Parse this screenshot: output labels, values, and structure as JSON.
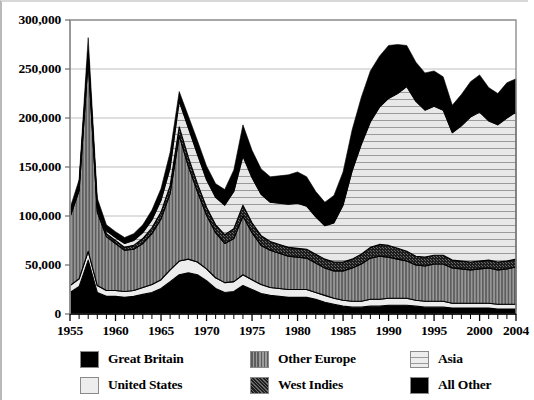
{
  "chart_data": {
    "type": "area",
    "stacked": true,
    "title": "",
    "xlabel": "",
    "ylabel": "",
    "xlim": [
      1955,
      2004
    ],
    "ylim": [
      0,
      300000
    ],
    "ytick_labels": [
      "0",
      "50,000",
      "100,000",
      "150,000",
      "200,000",
      "250,000",
      "300,000"
    ],
    "ytick_values": [
      0,
      50000,
      100000,
      150000,
      200000,
      250000,
      300000
    ],
    "xtick_labels": [
      "1955",
      "1960",
      "1965",
      "1970",
      "1975",
      "1980",
      "1985",
      "1990",
      "1995",
      "2000",
      "2004"
    ],
    "xtick_values": [
      1955,
      1960,
      1965,
      1970,
      1975,
      1980,
      1985,
      1990,
      1995,
      2000,
      2004
    ],
    "minor_xticks_every": 1,
    "grid": "horizontal",
    "grid_color": "#bfbfbf",
    "legend_position": "bottom",
    "x": [
      1955,
      1956,
      1957,
      1958,
      1959,
      1960,
      1961,
      1962,
      1963,
      1964,
      1965,
      1966,
      1967,
      1968,
      1969,
      1970,
      1971,
      1972,
      1973,
      1974,
      1975,
      1976,
      1977,
      1978,
      1979,
      1980,
      1981,
      1982,
      1983,
      1984,
      1985,
      1986,
      1987,
      1988,
      1989,
      1990,
      1991,
      1992,
      1993,
      1994,
      1995,
      1996,
      1997,
      1998,
      1999,
      2000,
      2001,
      2002,
      2003,
      2004
    ],
    "series": [
      {
        "name": "Great Britain",
        "color": "#000000",
        "pattern": "solid",
        "values": [
          22000,
          28000,
          55000,
          22000,
          18000,
          18000,
          17000,
          18000,
          20000,
          22000,
          26000,
          33000,
          40000,
          42000,
          40000,
          34000,
          26000,
          22000,
          23000,
          29000,
          25000,
          21000,
          19000,
          18000,
          17000,
          17000,
          17000,
          15000,
          12000,
          10000,
          8000,
          7000,
          7000,
          8000,
          8000,
          9000,
          9000,
          9000,
          8000,
          7000,
          7000,
          7000,
          6000,
          6000,
          6000,
          6000,
          6000,
          5000,
          5000,
          5000
        ]
      },
      {
        "name": "United States",
        "color": "#ededed",
        "pattern": "solid-light",
        "values": [
          7000,
          8000,
          9000,
          7000,
          6000,
          6000,
          6000,
          6000,
          7000,
          8000,
          9000,
          12000,
          14000,
          14000,
          13000,
          12000,
          11000,
          10000,
          10000,
          11000,
          10000,
          9000,
          8000,
          8000,
          8000,
          8000,
          8000,
          7000,
          7000,
          6000,
          6000,
          6000,
          6000,
          7000,
          7000,
          7000,
          7000,
          7000,
          6000,
          6000,
          6000,
          6000,
          5000,
          5000,
          5000,
          5000,
          5000,
          5000,
          5000,
          5000
        ]
      },
      {
        "name": "Other Europe",
        "color": "#7a7a7a",
        "pattern": "vertical-stripes",
        "values": [
          70000,
          90000,
          195000,
          75000,
          55000,
          48000,
          42000,
          42000,
          45000,
          52000,
          62000,
          78000,
          128000,
          95000,
          72000,
          55000,
          46000,
          40000,
          44000,
          60000,
          48000,
          40000,
          38000,
          36000,
          34000,
          33000,
          32000,
          30000,
          28000,
          28000,
          30000,
          34000,
          38000,
          42000,
          44000,
          42000,
          40000,
          38000,
          36000,
          36000,
          38000,
          38000,
          36000,
          35000,
          34000,
          35000,
          36000,
          35000,
          36000,
          38000
        ]
      },
      {
        "name": "West Indies",
        "color": "#2a2a2a",
        "pattern": "dense-dots",
        "values": [
          3000,
          4000,
          5000,
          4000,
          3000,
          3000,
          3000,
          4000,
          5000,
          6000,
          7000,
          8000,
          9000,
          9000,
          8000,
          8000,
          8000,
          9000,
          10000,
          11000,
          10000,
          10000,
          9000,
          9000,
          9000,
          9000,
          9000,
          9000,
          9000,
          9000,
          9000,
          9000,
          10000,
          11000,
          12000,
          12000,
          11000,
          10000,
          9000,
          9000,
          9000,
          9000,
          8000,
          8000,
          8000,
          8000,
          8000,
          8000,
          8000,
          8000
        ]
      },
      {
        "name": "Asia",
        "color": "#e3e3e3",
        "pattern": "horizontal-stripes",
        "values": [
          2000,
          2000,
          3000,
          3000,
          3000,
          3000,
          4000,
          5000,
          6000,
          8000,
          12000,
          18000,
          26000,
          30000,
          30000,
          28000,
          28000,
          30000,
          38000,
          50000,
          46000,
          42000,
          40000,
          42000,
          44000,
          46000,
          44000,
          38000,
          34000,
          40000,
          58000,
          90000,
          112000,
          128000,
          140000,
          150000,
          158000,
          168000,
          158000,
          150000,
          152000,
          148000,
          130000,
          138000,
          148000,
          152000,
          142000,
          140000,
          146000,
          150000
        ]
      },
      {
        "name": "All Other",
        "color": "#000000",
        "pattern": "solid",
        "values": [
          4000,
          5000,
          15000,
          7000,
          6000,
          6000,
          6000,
          7000,
          8000,
          10000,
          12000,
          16000,
          10000,
          12000,
          14000,
          14000,
          14000,
          16000,
          22000,
          32000,
          28000,
          26000,
          26000,
          28000,
          30000,
          32000,
          30000,
          26000,
          24000,
          28000,
          34000,
          42000,
          48000,
          52000,
          52000,
          54000,
          50000,
          42000,
          40000,
          38000,
          36000,
          34000,
          28000,
          32000,
          36000,
          38000,
          34000,
          32000,
          36000,
          34000
        ]
      }
    ]
  },
  "legend": {
    "items": [
      {
        "label": "Great Britain",
        "pattern": "solid",
        "color": "#000000"
      },
      {
        "label": "Other Europe",
        "pattern": "vertical-stripes",
        "color": "#7a7a7a"
      },
      {
        "label": "Asia",
        "pattern": "horizontal-stripes",
        "color": "#e3e3e3"
      },
      {
        "label": "United States",
        "pattern": "solid-light",
        "color": "#ededed"
      },
      {
        "label": "West Indies",
        "pattern": "dense-dots",
        "color": "#2a2a2a"
      },
      {
        "label": "All Other",
        "pattern": "solid",
        "color": "#000000"
      }
    ]
  }
}
